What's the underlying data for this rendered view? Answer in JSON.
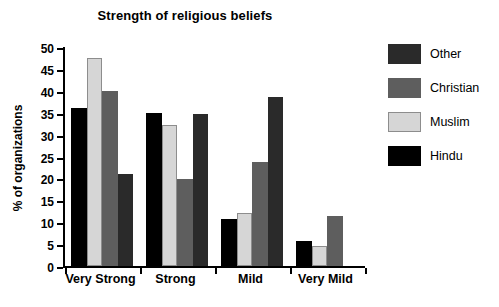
{
  "chart_data": {
    "type": "bar",
    "title": "Strength of religious beliefs",
    "xlabel": "",
    "ylabel": "% of organizations",
    "categories": [
      "Very Strong",
      "Strong",
      "Mild",
      "Very Mild"
    ],
    "ylim": [
      0,
      50
    ],
    "yticks": [
      0,
      5,
      10,
      15,
      20,
      25,
      30,
      35,
      40,
      45,
      50
    ],
    "grid": false,
    "legend_position": "right",
    "bar_order_in_group": [
      "Hindu",
      "Muslim",
      "Christian",
      "Other"
    ],
    "series": [
      {
        "name": "Other",
        "color": "#2a2a2a",
        "values": [
          21.0,
          34.8,
          38.7,
          0.0
        ]
      },
      {
        "name": "Christian",
        "color": "#5e5e5e",
        "values": [
          40.0,
          19.8,
          23.8,
          11.5
        ]
      },
      {
        "name": "Muslim",
        "color": "#d6d6d6",
        "values": [
          47.5,
          32.3,
          12.2,
          4.6
        ]
      },
      {
        "name": "Hindu",
        "color": "#000000",
        "values": [
          36.0,
          35.0,
          10.7,
          5.6
        ]
      }
    ]
  },
  "legend": {
    "items": [
      {
        "label": "Other"
      },
      {
        "label": "Christian"
      },
      {
        "label": "Muslim"
      },
      {
        "label": "Hindu"
      }
    ]
  },
  "axis": {
    "y_tick_labels": [
      "0",
      "5",
      "10",
      "15",
      "20",
      "25",
      "30",
      "35",
      "40",
      "45",
      "50"
    ],
    "y_title": "% of organizations"
  }
}
